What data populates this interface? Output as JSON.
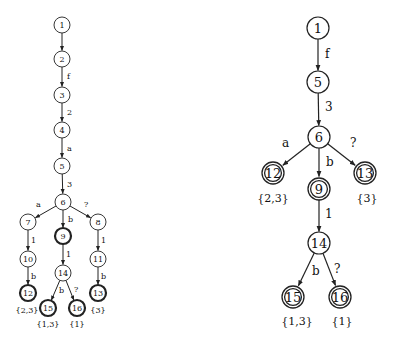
{
  "diagrams": [
    {
      "id": "left-tree",
      "style": "thick-final",
      "node_radius": 8,
      "font_size": 8,
      "edge_font_size": 8,
      "set_font_size": 8,
      "nodes": [
        {
          "id": "1",
          "x": 62,
          "y": 25,
          "final": false
        },
        {
          "id": "2",
          "x": 62,
          "y": 59,
          "final": false
        },
        {
          "id": "3",
          "x": 62,
          "y": 95,
          "final": false
        },
        {
          "id": "4",
          "x": 62,
          "y": 130,
          "final": false
        },
        {
          "id": "5",
          "x": 62,
          "y": 166,
          "final": false
        },
        {
          "id": "6",
          "x": 63,
          "y": 202,
          "final": false
        },
        {
          "id": "7",
          "x": 28,
          "y": 222,
          "final": false
        },
        {
          "id": "9",
          "x": 63,
          "y": 236,
          "final": true
        },
        {
          "id": "8",
          "x": 98,
          "y": 222,
          "final": false
        },
        {
          "id": "10",
          "x": 28,
          "y": 259,
          "final": false
        },
        {
          "id": "14",
          "x": 63,
          "y": 273,
          "final": false
        },
        {
          "id": "11",
          "x": 98,
          "y": 259,
          "final": false
        },
        {
          "id": "12",
          "x": 28,
          "y": 293,
          "final": true,
          "set": "{2,3}",
          "set_x": 27,
          "set_y": 310
        },
        {
          "id": "15",
          "x": 48,
          "y": 308,
          "final": true,
          "set": "{1,3}",
          "set_x": 48,
          "set_y": 324
        },
        {
          "id": "16",
          "x": 77,
          "y": 308,
          "final": true,
          "set": "{1}",
          "set_x": 77,
          "set_y": 324
        },
        {
          "id": "13",
          "x": 98,
          "y": 293,
          "final": true,
          "set": "{3}",
          "set_x": 98,
          "set_y": 310
        }
      ],
      "edges": [
        {
          "from": "1",
          "to": "2",
          "label": "",
          "lx": 0,
          "ly": 0
        },
        {
          "from": "2",
          "to": "3",
          "label": "f",
          "lx": 67,
          "ly": 76
        },
        {
          "from": "3",
          "to": "4",
          "label": "2",
          "lx": 67,
          "ly": 112
        },
        {
          "from": "4",
          "to": "5",
          "label": "a",
          "lx": 67,
          "ly": 148
        },
        {
          "from": "5",
          "to": "6",
          "label": "3",
          "lx": 67,
          "ly": 184
        },
        {
          "from": "6",
          "to": "7",
          "label": "a",
          "lx": 36,
          "ly": 204
        },
        {
          "from": "6",
          "to": "9",
          "label": "b",
          "lx": 68,
          "ly": 219
        },
        {
          "from": "6",
          "to": "8",
          "label": "?",
          "lx": 84,
          "ly": 204
        },
        {
          "from": "7",
          "to": "10",
          "label": "1",
          "lx": 31,
          "ly": 240
        },
        {
          "from": "9",
          "to": "14",
          "label": "1",
          "lx": 66,
          "ly": 254
        },
        {
          "from": "8",
          "to": "11",
          "label": "1",
          "lx": 101,
          "ly": 240
        },
        {
          "from": "10",
          "to": "12",
          "label": "b",
          "lx": 31,
          "ly": 276
        },
        {
          "from": "14",
          "to": "15",
          "label": "b",
          "lx": 59,
          "ly": 290
        },
        {
          "from": "14",
          "to": "16",
          "label": "?",
          "lx": 74,
          "ly": 289
        },
        {
          "from": "11",
          "to": "13",
          "label": "b",
          "lx": 101,
          "ly": 276
        }
      ]
    },
    {
      "id": "right-tree",
      "style": "double-final",
      "node_radius": 11,
      "font_size": 13,
      "edge_font_size": 12,
      "set_font_size": 11,
      "nodes": [
        {
          "id": "1",
          "x": 318,
          "y": 28,
          "final": false
        },
        {
          "id": "5",
          "x": 318,
          "y": 82,
          "final": false
        },
        {
          "id": "6",
          "x": 319,
          "y": 137,
          "final": false
        },
        {
          "id": "12",
          "x": 273,
          "y": 173,
          "final": true,
          "set": "{2,3}",
          "set_x": 273,
          "set_y": 198
        },
        {
          "id": "9",
          "x": 319,
          "y": 189,
          "final": true
        },
        {
          "id": "13",
          "x": 365,
          "y": 173,
          "final": true,
          "set": "{3}",
          "set_x": 367,
          "set_y": 198
        },
        {
          "id": "14",
          "x": 319,
          "y": 243,
          "final": false
        },
        {
          "id": "15",
          "x": 293,
          "y": 297,
          "final": true,
          "set": "{1,3}",
          "set_x": 297,
          "set_y": 321
        },
        {
          "id": "16",
          "x": 340,
          "y": 297,
          "final": true,
          "set": "{1}",
          "set_x": 342,
          "set_y": 321
        }
      ],
      "edges": [
        {
          "from": "1",
          "to": "5",
          "label": "f",
          "lx": 325,
          "ly": 54
        },
        {
          "from": "5",
          "to": "6",
          "label": "3",
          "lx": 325,
          "ly": 107
        },
        {
          "from": "6",
          "to": "12",
          "label": "a",
          "lx": 282,
          "ly": 143
        },
        {
          "from": "6",
          "to": "9",
          "label": "b",
          "lx": 326,
          "ly": 162
        },
        {
          "from": "6",
          "to": "13",
          "label": "?",
          "lx": 350,
          "ly": 143
        },
        {
          "from": "9",
          "to": "14",
          "label": "1",
          "lx": 325,
          "ly": 214
        },
        {
          "from": "14",
          "to": "15",
          "label": "b",
          "lx": 312,
          "ly": 271
        },
        {
          "from": "14",
          "to": "16",
          "label": "?",
          "lx": 334,
          "ly": 269
        }
      ]
    }
  ]
}
